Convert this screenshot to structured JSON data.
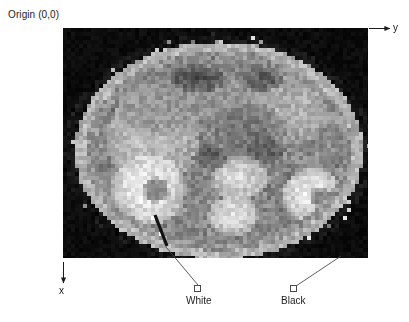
{
  "figure": {
    "origin_label": "Origin (0,0)",
    "axes": {
      "y_label": "y",
      "x_label": "x",
      "y_axis_name": "horizontal-column-axis",
      "x_axis_name": "vertical-row-axis"
    },
    "annotations": [
      {
        "id": "white-marker",
        "label": "White",
        "swatch_color": "#ffffff",
        "swatch_border": "#4a4a4a",
        "leader_from": [
          166,
          247
        ],
        "leader_to": [
          198,
          286
        ],
        "pointer_from": [
          155,
          215
        ],
        "pointer_to": [
          167,
          246
        ]
      },
      {
        "id": "black-marker",
        "label": "Black",
        "swatch_color": "#ffffff",
        "swatch_border": "#4a4a4a",
        "leader_from": [
          340,
          256
        ],
        "leader_to": [
          296,
          287
        ],
        "pointer_from": null,
        "pointer_to": null
      }
    ],
    "scan_image": {
      "description": "pixelated grayscale axial abdominal MR slice",
      "alt_text": "Pixelated grayscale axial abdominal scan",
      "frame": {
        "left": 63,
        "top": 28,
        "width": 305,
        "height": 230
      },
      "grid": {
        "cols": 76,
        "rows": 57,
        "block_px": 4
      },
      "palette": {
        "background": "#0a0a0a",
        "darkest": "#050505",
        "brightest": "#fdfdfd",
        "midtone": "#8d8d8d"
      },
      "anatomy_regions": [
        {
          "name": "background-air",
          "gray": 10
        },
        {
          "name": "body-fat-rim",
          "gray": 168
        },
        {
          "name": "muscle-wall",
          "gray": 118
        },
        {
          "name": "liver",
          "gray": 148
        },
        {
          "name": "spleen",
          "gray": 132
        },
        {
          "name": "right-kidney",
          "gray": 232
        },
        {
          "name": "left-kidney",
          "gray": 228
        },
        {
          "name": "vertebra-body",
          "gray": 214
        },
        {
          "name": "aorta",
          "gray": 96
        },
        {
          "name": "bowel-gas",
          "gray": 52
        }
      ]
    }
  }
}
